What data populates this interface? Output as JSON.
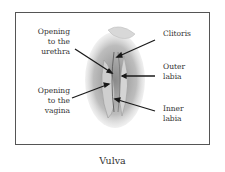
{
  "diagram": {
    "caption": "Vulva",
    "labels": {
      "urethra": "Opening to the urethra",
      "vagina": "Opening to the vagina",
      "clitoris": "Clitoris",
      "outer_labia": "Outer labia",
      "inner_labia": "Inner labia"
    },
    "label_lines": {
      "urethra": [
        "Opening",
        "to the",
        "urethra"
      ],
      "vagina": [
        "Opening",
        "to the",
        "vagina"
      ],
      "clitoris": [
        "Clitoris"
      ],
      "outer_labia": [
        "Outer",
        "labia"
      ],
      "inner_labia": [
        "Inner",
        "labia"
      ]
    }
  }
}
